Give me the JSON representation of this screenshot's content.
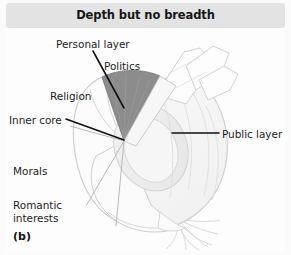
{
  "figure": {
    "panel_letter": "(b)",
    "header": {
      "title": "Depth but no breadth"
    },
    "colors": {
      "header_background": "#e3e3e3",
      "figure_background": "#fdfdfd",
      "wedge_fill": "#8c8c8c",
      "onion_outline": "#c9c9c9",
      "leader_line": "#111111",
      "text": "#1d1d1d"
    },
    "labels": {
      "personal_layer": "Personal layer",
      "politics": "Politics",
      "religion": "Religion",
      "inner_core": "Inner core",
      "public_layer": "Public layer",
      "morals": "Morals",
      "romantic_interests": "Romantic interests"
    },
    "diagram": {
      "subject": "cut-onion-layers",
      "description": "Onion with a wedge slice removed revealing concentric layers",
      "shaded_wedge": "Politics",
      "leader_lines": [
        {
          "label": "Personal layer",
          "from": [
            93,
            51
          ],
          "to": [
            124,
            108
          ]
        },
        {
          "label": "Inner core",
          "from": [
            66,
            119
          ],
          "to": [
            124,
            141
          ]
        },
        {
          "label": "Public layer",
          "from": [
            219,
            133
          ],
          "to": [
            173,
            133
          ]
        }
      ]
    }
  }
}
